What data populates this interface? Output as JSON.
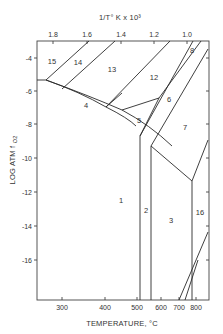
{
  "diagram": {
    "type": "stability-field phase diagram",
    "top_axis": {
      "title": "1/T° K x 10³",
      "ticks": [
        "1.8",
        "1.6",
        "1.4",
        "1.2",
        "1.0"
      ]
    },
    "bottom_axis": {
      "title": "TEMPERATURE, °C",
      "ticks": [
        "300",
        "400",
        "500",
        "600",
        "700",
        "800"
      ]
    },
    "left_axis": {
      "title": "LOG ATM f",
      "title_subscript": "O2",
      "ticks": [
        "-4",
        "-6",
        "-8",
        "-10",
        "-12",
        "-14",
        "-16"
      ]
    },
    "regions": [
      {
        "id": "1",
        "label": "1"
      },
      {
        "id": "2",
        "label": "2"
      },
      {
        "id": "3",
        "label": "3"
      },
      {
        "id": "4",
        "label": "4"
      },
      {
        "id": "5",
        "label": "5"
      },
      {
        "id": "6",
        "label": "6"
      },
      {
        "id": "7",
        "label": "7"
      },
      {
        "id": "8",
        "label": "8"
      },
      {
        "id": "12",
        "label": "12"
      },
      {
        "id": "13",
        "label": "13"
      },
      {
        "id": "14",
        "label": "14"
      },
      {
        "id": "15",
        "label": "15"
      },
      {
        "id": "16",
        "label": "16"
      }
    ]
  }
}
